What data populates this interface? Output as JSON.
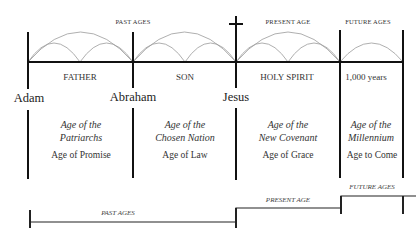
{
  "top_labels": {
    "past_ages": "PAST AGES",
    "present_age": "PRESENT AGE",
    "future_ages": "FUTURE AGES"
  },
  "eras": [
    {
      "label": "FATHER"
    },
    {
      "label": "SON"
    },
    {
      "label": "HOLY SPIRIT"
    },
    {
      "label": "1,000 years"
    }
  ],
  "markers": [
    {
      "name": "Adam"
    },
    {
      "name": "Abraham"
    },
    {
      "name": "Jesus",
      "icon": "cross-icon"
    }
  ],
  "ages": [
    {
      "title_line1": "Age of the",
      "title_line2": "Patriarchs",
      "subtitle": "Age of Promise"
    },
    {
      "title_line1": "Age of the",
      "title_line2": "Chosen Nation",
      "subtitle": "Age of Law"
    },
    {
      "title_line1": "Age of the",
      "title_line2": "New Covenant",
      "subtitle": "Age of Grace"
    },
    {
      "title_line1": "Age of the",
      "title_line2": "Millennium",
      "subtitle": "Age to Come"
    }
  ],
  "bottom_timeline": {
    "past_ages": "PAST AGES",
    "present_age": "PRESENT AGE",
    "future_ages": "FUTURE AGES"
  },
  "colors": {
    "line": "#111111",
    "arc": "#9a9a9a",
    "text": "#333333"
  }
}
